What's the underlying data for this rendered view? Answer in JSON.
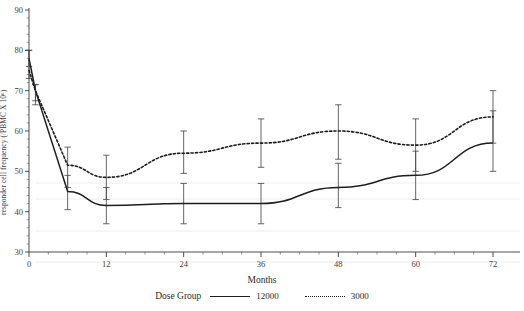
{
  "chart_data": {
    "type": "line",
    "title": "",
    "xlabel": "Months",
    "ylabel": "responder cell frequency (/PBMC X 10⁶)",
    "xlim": [
      0,
      72
    ],
    "ylim": [
      30,
      90
    ],
    "xticks": [
      0,
      12,
      24,
      36,
      48,
      60,
      72
    ],
    "yticks": [
      30,
      40,
      50,
      60,
      70,
      80,
      90
    ],
    "grid": false,
    "legend_title": "Dose Group",
    "legend_position": "bottom",
    "x": [
      0,
      1,
      6,
      12,
      24,
      36,
      48,
      60,
      72
    ],
    "series": [
      {
        "name": "12000",
        "style": "solid",
        "values": [
          78.0,
          70.0,
          45.0,
          41.5,
          42.0,
          42.0,
          46.0,
          49.0,
          57.0
        ],
        "ci_low": [
          76.0,
          67.5,
          40.5,
          37.0,
          37.0,
          37.0,
          41.0,
          43.0,
          50.0
        ],
        "ci_high": [
          80.0,
          71.5,
          49.0,
          46.0,
          47.0,
          47.0,
          52.0,
          55.0,
          65.0
        ]
      },
      {
        "name": "3000",
        "style": "dotted",
        "values": [
          75.0,
          70.0,
          51.5,
          48.5,
          54.5,
          57.0,
          60.0,
          56.5,
          63.5
        ],
        "ci_low": [
          73.0,
          66.5,
          46.0,
          43.0,
          49.5,
          51.0,
          53.0,
          50.0,
          57.0
        ],
        "ci_high": [
          80.0,
          71.5,
          56.0,
          54.0,
          60.0,
          63.0,
          66.5,
          63.0,
          70.0
        ]
      }
    ]
  },
  "axis": {
    "y_title": "responder cell frequency (/PBMC X 10⁶)",
    "x_title": "Months",
    "y_tick_labels": [
      "90",
      "80",
      "70",
      "60",
      "50",
      "40",
      "30"
    ],
    "x_tick_labels": [
      "0",
      "12",
      "24",
      "36",
      "48",
      "60",
      "72"
    ]
  },
  "legend": {
    "title": "Dose Group",
    "items": [
      {
        "label": "12000",
        "style": "solid"
      },
      {
        "label": "3000",
        "style": "dotted"
      }
    ]
  },
  "colors": {
    "line": "#1d1d1d",
    "error_bar": "#4a4a4a",
    "axis": "#3a3a3a",
    "background": "#ffffff"
  }
}
